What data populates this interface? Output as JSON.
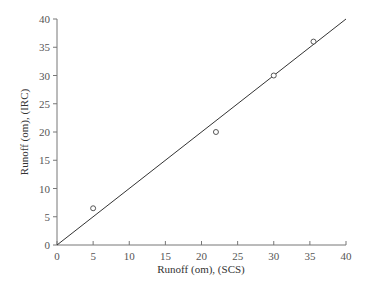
{
  "chart_data": {
    "type": "scatter",
    "title": "",
    "xlabel": "Runoff (om), (SCS)",
    "ylabel": "Runoff (om), (IRC)",
    "xlim": [
      0,
      40
    ],
    "ylim": [
      0,
      40
    ],
    "x_ticks": [
      0,
      5,
      10,
      15,
      20,
      25,
      30,
      35,
      40
    ],
    "y_ticks": [
      0,
      5,
      10,
      15,
      20,
      25,
      30,
      35,
      40
    ],
    "grid": false,
    "legend": null,
    "series": [
      {
        "name": "Observed",
        "marker": "open-circle",
        "points": [
          {
            "x": 5,
            "y": 6.5
          },
          {
            "x": 22,
            "y": 20
          },
          {
            "x": 30,
            "y": 30
          },
          {
            "x": 35.5,
            "y": 36
          }
        ]
      },
      {
        "name": "1:1 line",
        "type": "line",
        "points": [
          {
            "x": 0,
            "y": 0
          },
          {
            "x": 40,
            "y": 40
          }
        ]
      }
    ]
  },
  "colors": {
    "axis": "#777777",
    "line": "#333333",
    "marker": "#444444",
    "text": "#555555"
  }
}
